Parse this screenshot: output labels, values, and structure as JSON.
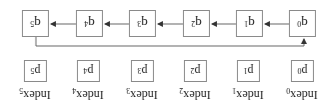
{
  "diagram": {
    "orientation": "rotated-180",
    "queue_nodes": [
      {
        "base": "q",
        "sub": "0"
      },
      {
        "base": "q",
        "sub": "1"
      },
      {
        "base": "q",
        "sub": "2"
      },
      {
        "base": "q",
        "sub": "3"
      },
      {
        "base": "q",
        "sub": "4"
      },
      {
        "base": "q",
        "sub": "5"
      }
    ],
    "p_nodes": [
      {
        "base": "p",
        "sub": "0"
      },
      {
        "base": "p",
        "sub": "1"
      },
      {
        "base": "p",
        "sub": "2"
      },
      {
        "base": "p",
        "sub": "3"
      },
      {
        "base": "p",
        "sub": "4"
      },
      {
        "base": "p",
        "sub": "5"
      }
    ],
    "index_labels": [
      {
        "base": "Index",
        "sub": "0"
      },
      {
        "base": "Index",
        "sub": "1"
      },
      {
        "base": "Index",
        "sub": "2"
      },
      {
        "base": "Index",
        "sub": "3"
      },
      {
        "base": "Index",
        "sub": "4"
      },
      {
        "base": "Index",
        "sub": "5"
      }
    ],
    "edges": [
      "q0->q1",
      "q1->q2",
      "q2->q3",
      "q3->q4",
      "q4->q5",
      "q5->q0 (feedback)"
    ],
    "colors": {
      "stroke": "#8a8a8a",
      "text": "#222222",
      "arrow": "#333333"
    }
  }
}
